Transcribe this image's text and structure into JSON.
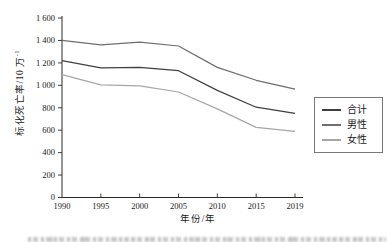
{
  "chart_data": {
    "type": "line",
    "title": "",
    "xlabel": "年份/年",
    "ylabel_main": "标化死亡率/10 万",
    "ylabel_sup": "-1",
    "x_categories": [
      "1990",
      "1995",
      "2000",
      "2005",
      "2010",
      "2015",
      "2019"
    ],
    "ylim": [
      0,
      1600
    ],
    "ytick_step": 200,
    "ytick_labels": [
      "0",
      "200",
      "400",
      "600",
      "800",
      "1 000",
      "1 200",
      "1 400",
      "1 600"
    ],
    "grid": false,
    "legend_position": "right",
    "series": [
      {
        "name": "合计",
        "color": "#3f3f3f",
        "values": [
          1220,
          1155,
          1160,
          1130,
          955,
          805,
          750
        ]
      },
      {
        "name": "男性",
        "color": "#6e6e6e",
        "values": [
          1400,
          1360,
          1385,
          1350,
          1160,
          1045,
          965
        ]
      },
      {
        "name": "女性",
        "color": "#a6a6a6",
        "values": [
          1095,
          1005,
          995,
          940,
          790,
          625,
          590
        ]
      }
    ]
  }
}
